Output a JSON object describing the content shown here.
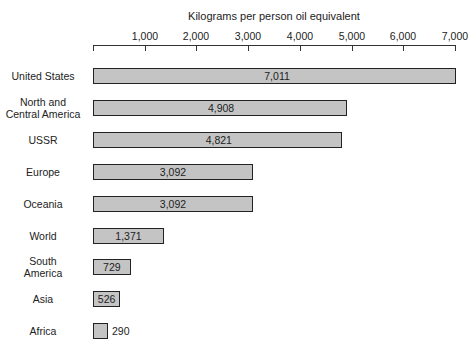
{
  "chart_data": {
    "type": "bar",
    "orientation": "horizontal",
    "title": "Kilograms per person oil equivalent",
    "xlabel": "Kilograms per person oil equivalent",
    "ylabel": "",
    "xlim": [
      0,
      7000
    ],
    "x_ticks": [
      "1,000",
      "2,000",
      "3,000",
      "4,000",
      "5,000",
      "6,000",
      "7,000"
    ],
    "grid": false,
    "legend": null,
    "categories": [
      "United States",
      "North and Central America",
      "USSR",
      "Europe",
      "Oceania",
      "World",
      "South America",
      "Asia",
      "Africa"
    ],
    "values": [
      7011,
      4908,
      4821,
      3092,
      3092,
      1371,
      729,
      526,
      290
    ],
    "value_labels": [
      "7,011",
      "4,908",
      "4,821",
      "3,092",
      "3,092",
      "1,371",
      "729",
      "526",
      "290"
    ],
    "category_lines": [
      [
        "United States"
      ],
      [
        "North and",
        "Central America"
      ],
      [
        "USSR"
      ],
      [
        "Europe"
      ],
      [
        "Oceania"
      ],
      [
        "World"
      ],
      [
        "South",
        "America"
      ],
      [
        "Asia"
      ],
      [
        "Africa"
      ]
    ],
    "colors": {
      "bar_fill": "#c4c4c4",
      "bar_border": "#222222"
    }
  }
}
